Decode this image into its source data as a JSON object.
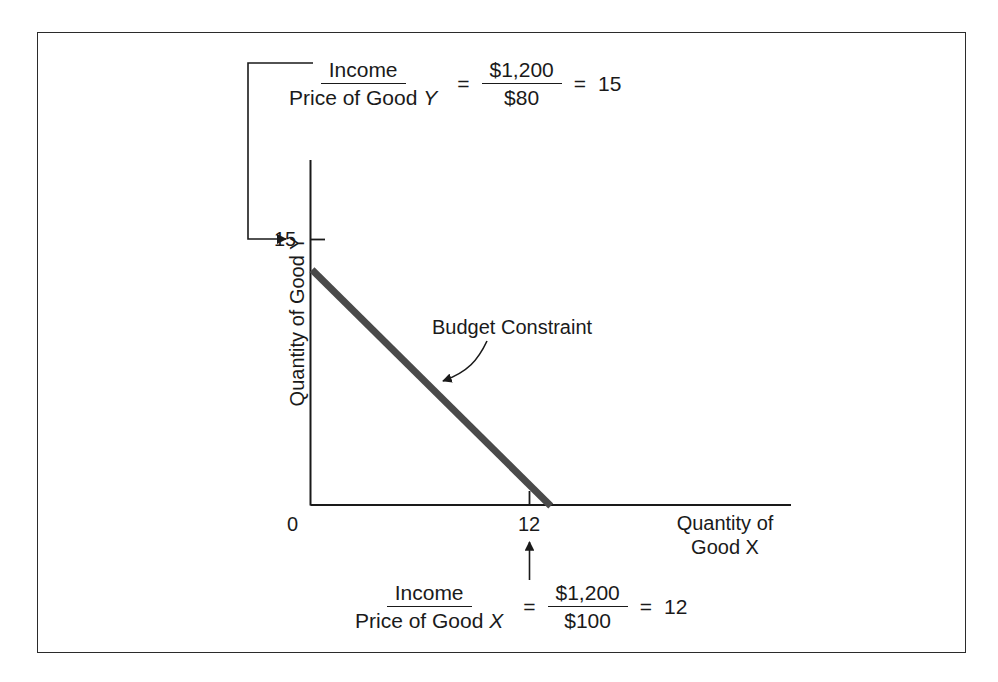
{
  "figure": {
    "type": "budget-constraint-diagram",
    "background_color": "#ffffff",
    "border_color": "#2b2b2b",
    "line_color": "#4a4a4a"
  },
  "axes": {
    "y_title": "Quantity of Good Y",
    "x_title_line1": "Quantity of",
    "x_title_line2": "Good X",
    "origin_label": "0",
    "y_tick_label": "15",
    "x_tick_label": "12"
  },
  "annotation": {
    "label": "Budget Constraint"
  },
  "formula_top": {
    "numerator": "Income",
    "denominator_text": "Price of Good ",
    "denominator_var": "Y",
    "equals1": "=",
    "value_numerator": "$1,200",
    "value_denominator": "$80",
    "equals2": "=",
    "result": "15"
  },
  "formula_bottom": {
    "numerator": "Income",
    "denominator_text": "Price of Good ",
    "denominator_var": "X",
    "equals1": "=",
    "value_numerator": "$1,200",
    "value_denominator": "$100",
    "equals2": "=",
    "result": "12"
  },
  "chart_data": {
    "type": "line",
    "title": "",
    "xlabel": "Quantity of Good X",
    "ylabel": "Quantity of Good Y",
    "xlim": [
      0,
      24
    ],
    "ylim": [
      0,
      22
    ],
    "xticks": [
      0,
      12
    ],
    "yticks": [
      15
    ],
    "xtick_labels": [
      "0",
      "12"
    ],
    "ytick_labels": [
      "15"
    ],
    "grid": false,
    "legend": "none",
    "series": [
      {
        "name": "Budget Constraint",
        "x": [
          0,
          12
        ],
        "y": [
          15,
          0
        ],
        "color": "#4a4a4a",
        "linewidth": 7
      }
    ],
    "annotations": [
      {
        "text": "Budget Constraint",
        "points_to": [
          6.1,
          7.6
        ]
      },
      {
        "text": "Income / Price of Good Y = $1,200 / $80 = 15",
        "points_to": [
          0,
          15
        ]
      },
      {
        "text": "Income / Price of Good X = $1,200 / $100 = 12",
        "points_to": [
          12,
          0
        ]
      }
    ]
  }
}
